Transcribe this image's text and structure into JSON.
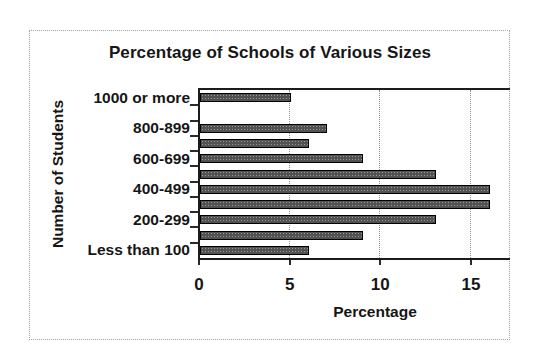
{
  "window": {
    "background": "#ffffff",
    "frame_border_color": "#a6a6a6"
  },
  "chart_data": {
    "type": "bar",
    "orientation": "horizontal",
    "title": "Percentage of Schools of Various Sizes",
    "xlabel": "Percentage",
    "ylabel": "Number of Students",
    "xlim": [
      0,
      17.2
    ],
    "xticks": [
      0,
      5,
      10,
      15
    ],
    "grid": "vertical dotted gridlines at 5, 10, 15",
    "legend": "none",
    "bar_color": "#525252",
    "bar_border_color": "#000000",
    "bars_top_to_bottom": [
      {
        "label": "1000 or more",
        "value": 5
      },
      {
        "label": "",
        "value": 0
      },
      {
        "label": "800-899",
        "value": 7
      },
      {
        "label": "",
        "value": 6
      },
      {
        "label": "600-699",
        "value": 9
      },
      {
        "label": "",
        "value": 13
      },
      {
        "label": "400-499",
        "value": 16
      },
      {
        "label": "",
        "value": 16
      },
      {
        "label": "200-299",
        "value": 13
      },
      {
        "label": "",
        "value": 9
      },
      {
        "label": "Less than 100",
        "value": 6
      }
    ]
  }
}
